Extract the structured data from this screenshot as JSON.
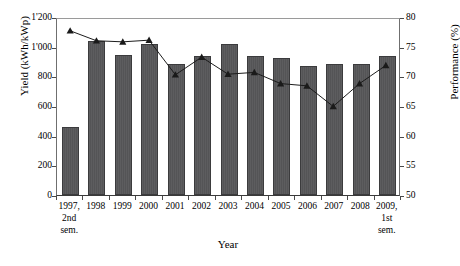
{
  "chart_data": {
    "type": "bar",
    "title": "",
    "xlabel": "Year",
    "ylabel": "Yield (kWh/kWp)",
    "y2label": "Performance (%)",
    "grid": false,
    "legend": "none",
    "categories": [
      "1997, 2nd sem.",
      "1998",
      "1999",
      "2000",
      "2001",
      "2002",
      "2003",
      "2004",
      "2005",
      "2006",
      "2007",
      "2008",
      "2009, 1st sem."
    ],
    "category_lines": [
      [
        "1997,",
        "2nd",
        "sem."
      ],
      [
        "1998"
      ],
      [
        "1999"
      ],
      [
        "2000"
      ],
      [
        "2001"
      ],
      [
        "2002"
      ],
      [
        "2003"
      ],
      [
        "2004"
      ],
      [
        "2005"
      ],
      [
        "2006"
      ],
      [
        "2007"
      ],
      [
        "2008"
      ],
      [
        "2009,",
        "1st",
        "sem."
      ]
    ],
    "ylim": [
      0,
      1200
    ],
    "yticks": [
      0,
      200,
      400,
      600,
      800,
      1000,
      1200
    ],
    "ytick_labels": [
      "0",
      "200",
      "400",
      "600",
      "800",
      "1'000",
      "1'200"
    ],
    "y2lim": [
      50,
      80
    ],
    "y2ticks": [
      50,
      55,
      60,
      65,
      70,
      75,
      80
    ],
    "y2tick_labels": [
      "50",
      "55",
      "60",
      "65",
      "70",
      "75",
      "80"
    ],
    "series": [
      {
        "name": "Yield",
        "type": "bar",
        "axis": "left",
        "color": "#58585a",
        "values": [
          460,
          1035,
          945,
          1015,
          885,
          935,
          1020,
          940,
          925,
          870,
          880,
          885,
          935
        ]
      },
      {
        "name": "Performance",
        "type": "line",
        "axis": "right",
        "color": "#1a1a1a",
        "marker": "triangle",
        "values": [
          78.0,
          76.3,
          76.1,
          76.4,
          70.5,
          73.5,
          70.6,
          70.9,
          69.0,
          68.6,
          65.1,
          69.0,
          72.1
        ]
      }
    ]
  }
}
